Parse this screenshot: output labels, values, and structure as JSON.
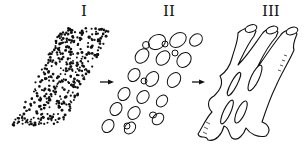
{
  "diagram": {
    "type": "process-sequence",
    "stages": [
      {
        "label": "I",
        "depiction": "dense scattered dots in diagonal band"
      },
      {
        "label": "II",
        "depiction": "ellipsoid granules in diagonal band"
      },
      {
        "label": "III",
        "depiction": "branched tubular network with elongated holes"
      }
    ],
    "arrows": [
      {
        "from": "I",
        "to": "II"
      },
      {
        "from": "II",
        "to": "III"
      }
    ],
    "colors": {
      "ink": "#111111",
      "background": "#ffffff"
    }
  }
}
